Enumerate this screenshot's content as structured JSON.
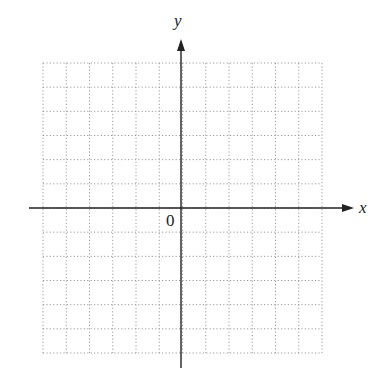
{
  "diagram": {
    "type": "coordinate-plane",
    "axes": {
      "x_label": "x",
      "y_label": "y",
      "origin_label": "0"
    },
    "grid": {
      "columns": 12,
      "rows": 12,
      "x_range": [
        -6,
        6
      ],
      "y_range": [
        -6,
        6
      ],
      "line_style": "dotted",
      "line_color": "#9a9a9a"
    },
    "colors": {
      "axis": "#222222",
      "background": "#ffffff"
    }
  }
}
